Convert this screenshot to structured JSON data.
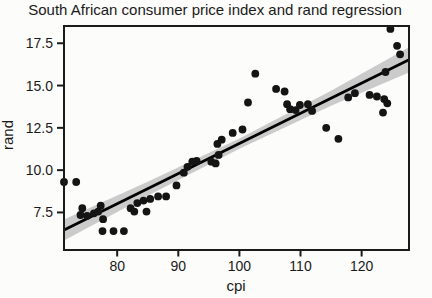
{
  "chart_data": {
    "type": "scatter",
    "title": "South African consumer price index and rand regression",
    "xlabel": "cpi",
    "ylabel": "rand",
    "xlim": [
      71.3,
      127.75
    ],
    "ylim": [
      5.28,
      18.52
    ],
    "xticks": [
      80,
      90,
      100,
      110,
      120
    ],
    "xticklabels": [
      "80",
      "90",
      "100",
      "110",
      "120"
    ],
    "yticks": [
      7.5,
      10.0,
      12.5,
      15.0,
      17.5
    ],
    "yticklabels": [
      "7.5",
      "10.0",
      "12.5",
      "15.0",
      "17.5"
    ],
    "grid": false,
    "legend": "none",
    "points": [
      [
        71.3,
        9.3
      ],
      [
        73.3,
        9.3
      ],
      [
        74.0,
        7.35
      ],
      [
        74.3,
        7.75
      ],
      [
        75.1,
        7.3
      ],
      [
        76.2,
        7.45
      ],
      [
        76.9,
        7.55
      ],
      [
        77.3,
        7.9
      ],
      [
        77.6,
        6.4
      ],
      [
        77.7,
        7.1
      ],
      [
        79.4,
        6.4
      ],
      [
        81.1,
        6.4
      ],
      [
        82.2,
        7.75
      ],
      [
        82.8,
        7.55
      ],
      [
        83.3,
        8.05
      ],
      [
        84.3,
        8.2
      ],
      [
        84.8,
        7.55
      ],
      [
        85.4,
        8.3
      ],
      [
        86.7,
        8.45
      ],
      [
        88.0,
        8.45
      ],
      [
        89.7,
        9.1
      ],
      [
        90.9,
        9.85
      ],
      [
        91.5,
        10.2
      ],
      [
        92.3,
        10.5
      ],
      [
        93.0,
        10.55
      ],
      [
        95.4,
        10.5
      ],
      [
        96.1,
        10.4
      ],
      [
        96.6,
        10.9
      ],
      [
        96.4,
        11.55
      ],
      [
        97.1,
        11.8
      ],
      [
        98.9,
        12.2
      ],
      [
        100.5,
        12.4
      ],
      [
        101.4,
        14.0
      ],
      [
        102.6,
        15.7
      ],
      [
        106.0,
        14.8
      ],
      [
        107.4,
        14.65
      ],
      [
        107.8,
        13.9
      ],
      [
        108.3,
        13.6
      ],
      [
        109.2,
        13.55
      ],
      [
        109.9,
        13.85
      ],
      [
        111.2,
        13.9
      ],
      [
        111.9,
        13.5
      ],
      [
        114.2,
        12.5
      ],
      [
        116.2,
        11.85
      ],
      [
        117.8,
        14.3
      ],
      [
        118.9,
        14.55
      ],
      [
        121.3,
        14.45
      ],
      [
        122.5,
        14.35
      ],
      [
        123.5,
        13.4
      ],
      [
        123.7,
        14.2
      ],
      [
        124.2,
        13.95
      ],
      [
        123.9,
        15.8
      ],
      [
        124.7,
        18.35
      ],
      [
        125.8,
        17.35
      ],
      [
        126.3,
        16.85
      ]
    ],
    "regression_line": {
      "cpi": [
        71.3,
        127.75
      ],
      "rand": [
        6.46,
        16.52
      ]
    },
    "confidence_band": {
      "cpi": [
        71.3,
        85.0,
        100.0,
        115.0,
        127.75
      ],
      "upper": [
        7.08,
        9.32,
        11.87,
        14.7,
        17.27
      ],
      "lower": [
        5.84,
        8.48,
        11.27,
        13.8,
        15.77
      ]
    },
    "colors": {
      "point": "#141414",
      "line": "#000000",
      "band": "#cbcbcb",
      "axis": "#1b1b1b",
      "text": "#1a1a1a",
      "background": "#fcfcfa"
    }
  }
}
